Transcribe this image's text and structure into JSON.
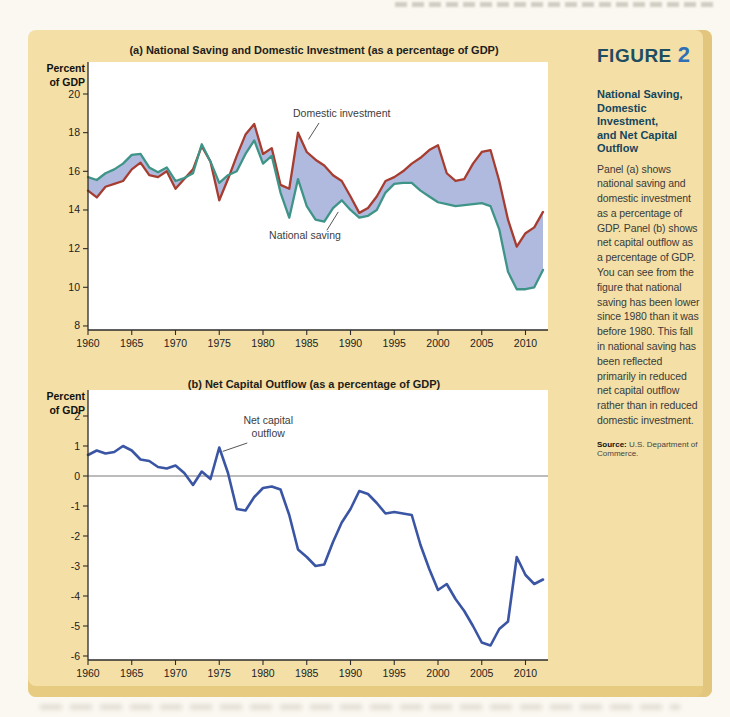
{
  "colors": {
    "page_bg": "#FBF8F1",
    "panel_bg": "#F4E0A6",
    "panel_edge_right": "#E2C67D",
    "panel_edge_bottom": "#E7CB81",
    "investment_line": "#A63D30",
    "saving_line": "#3F9488",
    "fill_between": "#B0BADF",
    "nco_line": "#3A55A4"
  },
  "page": {
    "figure_label": {
      "word": "FIGURE",
      "number": "2",
      "word_color": "#1E4D62",
      "number_color": "#2F6FB6"
    }
  },
  "sidebar": {
    "caption_title": "National Saving,\nDomestic Investment,\nand Net Capital\nOutflow",
    "caption_title_color": "#15465E",
    "body": "Panel (a) shows national saving and domestic investment as a percentage of GDP. Panel (b) shows net capital outflow as a percentage of GDP. You can see from the figure that national saving has been lower since 1980 than it was before 1980. This fall in national saving has been reflected primarily in reduced net capital outflow rather than in reduced domestic investment.",
    "source_label": "Source:",
    "source_text": "U.S. Department of Commerce."
  },
  "chart_data": [
    {
      "id": "panel-a",
      "type": "area",
      "title": "(a) National Saving and Domestic Investment (as a percentage of GDP)",
      "ylabel_lines": [
        "Percent",
        "of GDP"
      ],
      "ylim": [
        8,
        20
      ],
      "yticks": [
        20,
        18,
        16,
        14,
        12,
        10,
        8
      ],
      "xticks": [
        1960,
        1965,
        1970,
        1975,
        1980,
        1985,
        1990,
        1995,
        2000,
        2005,
        2010
      ],
      "x": [
        1960,
        1961,
        1962,
        1963,
        1964,
        1965,
        1966,
        1967,
        1968,
        1969,
        1970,
        1971,
        1972,
        1973,
        1974,
        1975,
        1976,
        1977,
        1978,
        1979,
        1980,
        1981,
        1982,
        1983,
        1984,
        1985,
        1986,
        1987,
        1988,
        1989,
        1990,
        1991,
        1992,
        1993,
        1994,
        1995,
        1996,
        1997,
        1998,
        1999,
        2000,
        2001,
        2002,
        2003,
        2004,
        2005,
        2006,
        2007,
        2008,
        2009,
        2010,
        2011,
        2012
      ],
      "fill_between": true,
      "fill_between_color": "#B0BADF",
      "series": [
        {
          "name": "Domestic investment",
          "color": "#A63D30",
          "values": [
            15.0,
            14.65,
            15.2,
            15.35,
            15.5,
            16.1,
            16.45,
            15.8,
            15.7,
            16.0,
            15.1,
            15.6,
            16.1,
            17.3,
            16.5,
            14.5,
            15.6,
            16.8,
            17.9,
            18.45,
            16.9,
            17.2,
            15.3,
            15.1,
            18.0,
            17.0,
            16.6,
            16.3,
            15.8,
            15.5,
            14.7,
            13.85,
            14.1,
            14.7,
            15.5,
            15.7,
            16.0,
            16.4,
            16.7,
            17.1,
            17.35,
            15.9,
            15.5,
            15.6,
            16.4,
            17.0,
            17.1,
            15.5,
            13.5,
            12.1,
            12.8,
            13.1,
            13.9
          ]
        },
        {
          "name": "National saving",
          "color": "#3F9488",
          "values": [
            15.7,
            15.55,
            15.9,
            16.1,
            16.4,
            16.85,
            16.9,
            16.2,
            15.95,
            16.2,
            15.5,
            15.65,
            15.9,
            17.4,
            16.5,
            15.4,
            15.8,
            16.0,
            16.9,
            17.6,
            16.4,
            16.8,
            14.9,
            13.6,
            15.6,
            14.2,
            13.5,
            13.4,
            14.1,
            14.5,
            14.0,
            13.6,
            13.7,
            14.0,
            14.9,
            15.35,
            15.4,
            15.4,
            15.0,
            14.7,
            14.4,
            14.3,
            14.2,
            14.25,
            14.3,
            14.35,
            14.2,
            13.0,
            10.8,
            9.9,
            9.9,
            10.0,
            10.9
          ]
        }
      ],
      "annotations": [
        {
          "text_lines": [
            "Domestic investment"
          ],
          "label": {
            "year": 1989,
            "value": 18.8
          },
          "line": [
            {
              "year": 1986.4,
              "value": 18.5
            },
            {
              "year": 1985.2,
              "value": 17.65
            }
          ]
        },
        {
          "text_lines": [
            "National saving"
          ],
          "label": {
            "year": 1984.8,
            "value": 12.5
          },
          "line": [
            {
              "year": 1987.3,
              "value": 12.95
            },
            {
              "year": 1988.6,
              "value": 13.9
            }
          ]
        }
      ]
    },
    {
      "id": "panel-b",
      "type": "line",
      "title": "(b) Net Capital Outflow (as a percentage of GDP)",
      "ylabel_lines": [
        "Percent",
        "of GDP"
      ],
      "ylim": [
        -6,
        2
      ],
      "yticks": [
        2,
        1,
        0,
        -1,
        -2,
        -3,
        -4,
        -5,
        -6
      ],
      "xticks": [
        1960,
        1965,
        1970,
        1975,
        1980,
        1985,
        1990,
        1995,
        2000,
        2005,
        2010
      ],
      "zero_line": true,
      "x": [
        1960,
        1961,
        1962,
        1963,
        1964,
        1965,
        1966,
        1967,
        1968,
        1969,
        1970,
        1971,
        1972,
        1973,
        1974,
        1975,
        1976,
        1977,
        1978,
        1979,
        1980,
        1981,
        1982,
        1983,
        1984,
        1985,
        1986,
        1987,
        1988,
        1989,
        1990,
        1991,
        1992,
        1993,
        1994,
        1995,
        1996,
        1997,
        1998,
        1999,
        2000,
        2001,
        2002,
        2003,
        2004,
        2005,
        2006,
        2007,
        2008,
        2009,
        2010,
        2011,
        2012
      ],
      "series": [
        {
          "name": "Net capital outflow",
          "color": "#3A55A4",
          "width": 2.6,
          "values": [
            0.7,
            0.85,
            0.75,
            0.8,
            1.0,
            0.85,
            0.55,
            0.5,
            0.3,
            0.25,
            0.35,
            0.1,
            -0.3,
            0.15,
            -0.1,
            0.95,
            0.1,
            -1.1,
            -1.15,
            -0.7,
            -0.4,
            -0.35,
            -0.45,
            -1.3,
            -2.45,
            -2.7,
            -3.0,
            -2.95,
            -2.2,
            -1.55,
            -1.1,
            -0.5,
            -0.6,
            -0.9,
            -1.25,
            -1.2,
            -1.25,
            -1.3,
            -2.3,
            -3.1,
            -3.8,
            -3.6,
            -4.1,
            -4.5,
            -5.0,
            -5.55,
            -5.65,
            -5.1,
            -4.85,
            -2.7,
            -3.3,
            -3.6,
            -3.45
          ]
        }
      ],
      "annotations": [
        {
          "text_lines": [
            "Net capital",
            "outflow"
          ],
          "label": {
            "year": 1980.6,
            "value": 1.75
          },
          "line": [
            {
              "year": 1978.2,
              "value": 1.1
            },
            {
              "year": 1975.4,
              "value": 0.82
            }
          ]
        }
      ]
    }
  ]
}
